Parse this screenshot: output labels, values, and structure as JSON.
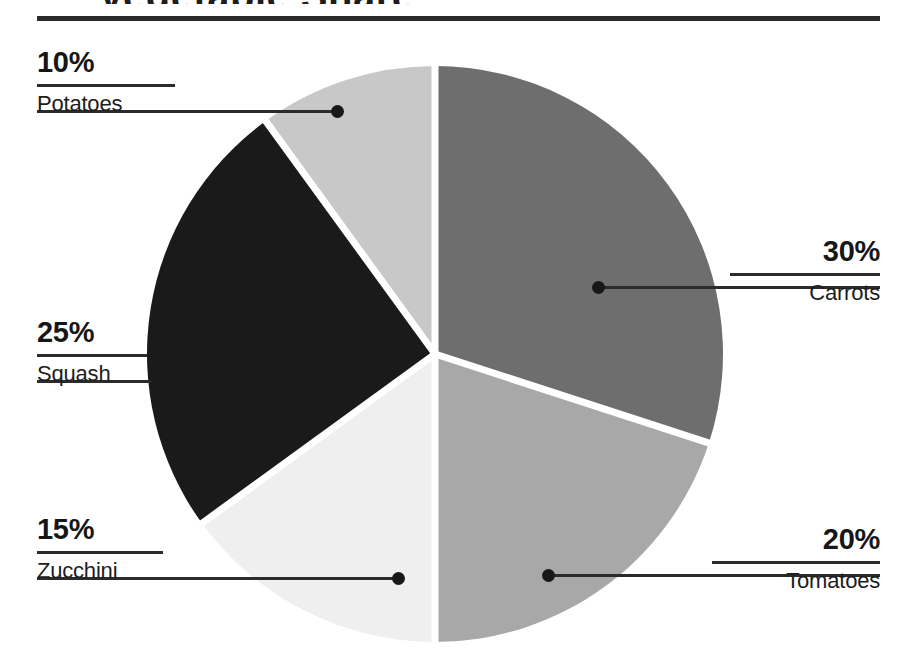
{
  "title": {
    "text_remnant": "Vegetable Share",
    "visible": "cut-off at top edge"
  },
  "chart_data": {
    "type": "pie",
    "title": "",
    "categories": [
      "Carrots",
      "Tomatoes",
      "Zucchini",
      "Squash",
      "Potatoes"
    ],
    "values": [
      30,
      20,
      15,
      25,
      10
    ],
    "value_labels": [
      "30%",
      "20%",
      "15%",
      "25%",
      "10%"
    ],
    "unit": "%",
    "total": 100,
    "start_angle_deg": 0,
    "direction": "clockwise",
    "legend": "none (direct callout labels)",
    "slice_gap": "white separator strokes",
    "colors": [
      "#6e6e6e",
      "#a8a8a8",
      "#efefef",
      "#1a1a1a",
      "#c8c8c8"
    ],
    "slices": [
      {
        "label": "Carrots",
        "value": 30,
        "value_label": "30%",
        "color": "#6e6e6e",
        "start_deg": 0,
        "end_deg": 108
      },
      {
        "label": "Tomatoes",
        "value": 20,
        "value_label": "20%",
        "color": "#a8a8a8",
        "start_deg": 108,
        "end_deg": 180
      },
      {
        "label": "Zucchini",
        "value": 15,
        "value_label": "15%",
        "color": "#efefef",
        "start_deg": 180,
        "end_deg": 234
      },
      {
        "label": "Squash",
        "value": 25,
        "value_label": "25%",
        "color": "#1a1a1a",
        "start_deg": 234,
        "end_deg": 324
      },
      {
        "label": "Potatoes",
        "value": 10,
        "value_label": "10%",
        "color": "#c8c8c8",
        "start_deg": 324,
        "end_deg": 360
      }
    ]
  },
  "callouts": {
    "potatoes": {
      "pct": "10%",
      "name": "Potatoes"
    },
    "squash": {
      "pct": "25%",
      "name": "Squash"
    },
    "zucchini": {
      "pct": "15%",
      "name": "Zucchini"
    },
    "carrots": {
      "pct": "30%",
      "name": "Carrots"
    },
    "tomatoes": {
      "pct": "20%",
      "name": "Tomatoes"
    }
  },
  "colors": {
    "ink": "#1d1d1d",
    "rule": "#2b2b2b",
    "background": "#ffffff"
  }
}
